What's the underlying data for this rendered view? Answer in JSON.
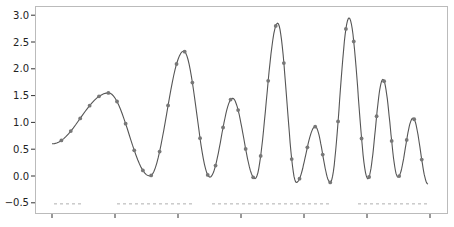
{
  "chart_data": {
    "type": "line",
    "title": "",
    "xlabel": "",
    "ylabel": "",
    "ylim": [
      -0.6,
      3.1
    ],
    "y_ticks": [
      "-0.5",
      "0.0",
      "0.5",
      "1.0",
      "1.5",
      "2.0",
      "2.5",
      "3.0"
    ],
    "x_tick_count": 7,
    "x_tick_labels": [],
    "grid": false,
    "legend": null,
    "series": [
      {
        "name": "curve",
        "style": "solid-line-with-markers",
        "color": "#555555",
        "keypoints": [
          {
            "x": 0.0,
            "y": 0.6
          },
          {
            "x": 0.15,
            "y": 1.55
          },
          {
            "x": 0.26,
            "y": 0.0
          },
          {
            "x": 0.35,
            "y": 2.33
          },
          {
            "x": 0.42,
            "y": -0.02
          },
          {
            "x": 0.48,
            "y": 1.45
          },
          {
            "x": 0.54,
            "y": -0.05
          },
          {
            "x": 0.6,
            "y": 2.85
          },
          {
            "x": 0.65,
            "y": -0.12
          },
          {
            "x": 0.7,
            "y": 0.92
          },
          {
            "x": 0.74,
            "y": -0.12
          },
          {
            "x": 0.79,
            "y": 2.95
          },
          {
            "x": 0.84,
            "y": -0.05
          },
          {
            "x": 0.88,
            "y": 1.8
          },
          {
            "x": 0.92,
            "y": -0.02
          },
          {
            "x": 0.96,
            "y": 1.08
          },
          {
            "x": 1.0,
            "y": -0.15
          }
        ]
      },
      {
        "name": "baseline-markers",
        "style": "faint-dashes",
        "y": -0.52,
        "color": "#aaaaaa"
      }
    ]
  },
  "axes": {
    "frame_color": "#bbbbbb",
    "line_color": "#555555",
    "marker_color": "#777777"
  }
}
